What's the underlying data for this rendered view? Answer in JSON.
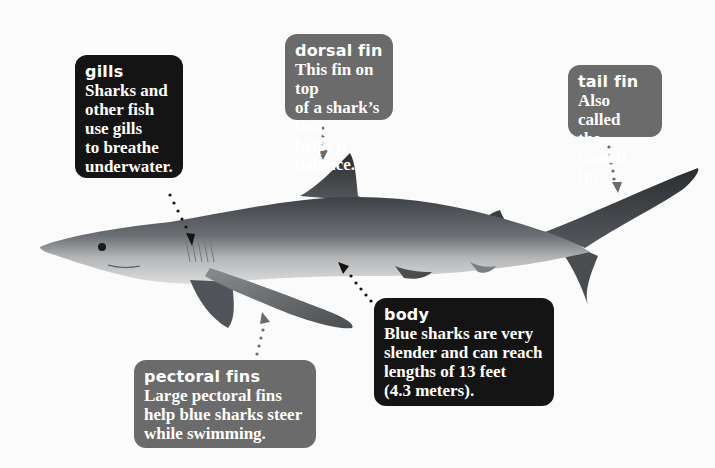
{
  "diagram": {
    "labels": [
      {
        "id": "gills",
        "title": "gills",
        "description": [
          "Sharks and",
          "other fish",
          "use gills",
          "to breathe",
          "underwater."
        ],
        "style": "dark"
      },
      {
        "id": "dorsal-fin",
        "title": "dorsal fin",
        "description": [
          "This fin on top",
          "of a shark’s body",
          "helps it balance."
        ],
        "style": "grey"
      },
      {
        "id": "tail-fin",
        "title": "tail fin",
        "description": [
          "Also called",
          "the caudal fin."
        ],
        "style": "grey"
      },
      {
        "id": "body",
        "title": "body",
        "description": [
          "Blue sharks are very",
          "slender and can reach",
          "lengths of 13 feet",
          "(4.3 meters)."
        ],
        "style": "dark"
      },
      {
        "id": "pectoral-fins",
        "title": "pectoral fins",
        "description": [
          "Large pectoral fins",
          "help blue sharks steer",
          "while swimming."
        ],
        "style": "grey"
      }
    ]
  },
  "colors": {
    "dark_box": "#141414",
    "grey_box": "#6b6b6b",
    "background": "#fbfbfb"
  }
}
